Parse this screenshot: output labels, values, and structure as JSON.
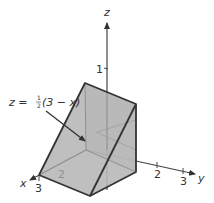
{
  "figure": {
    "axes": {
      "x": {
        "label": "x",
        "ticks": [
          "2",
          "3"
        ]
      },
      "y": {
        "label": "y",
        "ticks": [
          "2",
          "3"
        ]
      },
      "z": {
        "label": "z",
        "ticks": [
          "1"
        ]
      }
    },
    "annotation": {
      "lhs": "z =",
      "frac_num": "1",
      "frac_den": "2",
      "rhs": "(3 − x)"
    },
    "colors": {
      "fill": "#b4b4b4",
      "edge": "#333333",
      "axis": "#444444",
      "hidden": "#8a8a8a"
    }
  }
}
